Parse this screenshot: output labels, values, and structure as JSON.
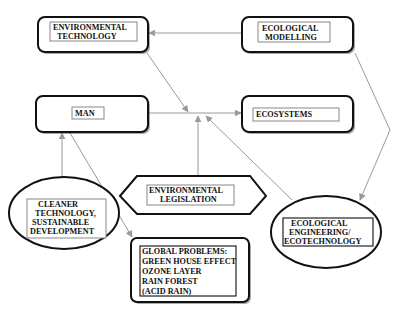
{
  "diagram": {
    "nodes": {
      "env_tech": {
        "lines": [
          "ENVIRONMENTAL",
          "TECHNOLOGY"
        ]
      },
      "eco_model": {
        "lines": [
          "ECOLOGICAL",
          "MODELLING"
        ]
      },
      "man": {
        "lines": [
          "MAN"
        ]
      },
      "ecosystems": {
        "lines": [
          "ECOSYSTEMS"
        ]
      },
      "cleaner": {
        "lines": [
          "CLEANER",
          "TECHNOLOGY,",
          "SUSTAINABLE",
          "DEVELOPMENT"
        ]
      },
      "legislation": {
        "lines": [
          "ENVIRONMENTAL",
          "LEGISLATION"
        ]
      },
      "eco_eng": {
        "lines": [
          "ECOLOGICAL",
          "ENGINEERING/",
          "ECOTECHNOLOGY"
        ]
      },
      "global": {
        "lines": [
          "GLOBAL PROBLEMS:",
          "GREEN HOUSE EFFECT",
          "OZONE LAYER",
          "RAIN FOREST",
          "(ACID RAIN)"
        ]
      }
    },
    "edges": [
      {
        "from": "ECOLOGICAL MODELLING",
        "to": "ENVIRONMENTAL TECHNOLOGY"
      },
      {
        "from": "ENVIRONMENTAL TECHNOLOGY",
        "to": "center"
      },
      {
        "from": "MAN",
        "to": "ECOSYSTEMS"
      },
      {
        "from": "ENVIRONMENTAL LEGISLATION",
        "to": "center"
      },
      {
        "from": "ECOLOGICAL ENGINEERING/ECOTECHNOLOGY",
        "to": "center"
      },
      {
        "from": "CLEANER TECHNOLOGY, SUSTAINABLE DEVELOPMENT",
        "to": "MAN"
      },
      {
        "from": "MAN",
        "to": "GLOBAL PROBLEMS"
      },
      {
        "from": "ECOLOGICAL MODELLING",
        "to": "ECOLOGICAL ENGINEERING/ECOTECHNOLOGY"
      }
    ],
    "colors": {
      "edge": "#9a9a9a",
      "border": "#111111",
      "inner_border": "#888888"
    }
  }
}
